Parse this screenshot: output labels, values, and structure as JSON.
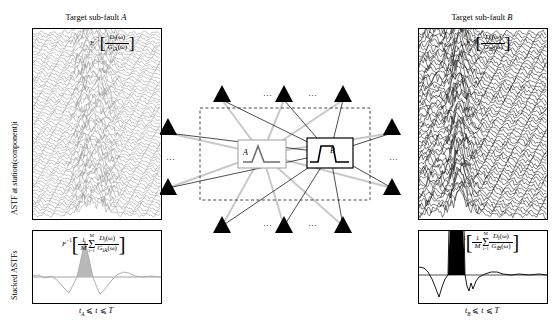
{
  "figure": {
    "type": "seismology-diagram"
  },
  "panels": {
    "left_top": {
      "title_prefix": "Target sub-fault ",
      "title_italic": "A",
      "y_axis_label": "ASTF at station(component)i",
      "formula": {
        "operator": "F",
        "operator_exponent": "−1",
        "numerator": "D",
        "numerator_sub": "i",
        "numerator_arg": "(ω)",
        "denominator": "G",
        "denominator_sub": "iA",
        "denominator_arg": "(ω)"
      }
    },
    "left_bottom": {
      "y_axis_label": "Stacked ASTFs",
      "x_axis_label": "tₐ ⩽ t ⩽ T",
      "x_axis_sub": "A",
      "formula": {
        "operator": "F",
        "operator_exponent": "−1",
        "mean_numerator": "1",
        "mean_denominator": "M",
        "sigma_upper": "M",
        "sigma_lower": "i=1",
        "numerator": "D",
        "numerator_sub": "i",
        "numerator_arg": "(ω)",
        "denominator": "G",
        "denominator_sub": "iA",
        "denominator_arg": "(ω)"
      }
    },
    "right_top": {
      "title_prefix": "Target sub-fault ",
      "title_italic": "B",
      "formula": {
        "operator": "F",
        "operator_exponent": "−1",
        "numerator": "D",
        "numerator_sub": "i",
        "numerator_arg": "(ω)",
        "denominator": "G",
        "denominator_sub": "iB",
        "denominator_arg": "(ω)"
      }
    },
    "right_bottom": {
      "x_axis_label": "t_B ⩽ t ⩽ T",
      "x_axis_sub": "B",
      "formula": {
        "operator": "F",
        "operator_exponent": "−1",
        "mean_numerator": "1",
        "mean_denominator": "M",
        "sigma_upper": "M",
        "sigma_lower": "i=1",
        "numerator": "D",
        "numerator_sub": "i",
        "numerator_arg": "(ω)",
        "denominator": "G",
        "denominator_sub": "iB",
        "denominator_arg": "(ω)"
      }
    }
  },
  "centre_diagram": {
    "subfault_a_label": "A",
    "subfault_b_label": "B",
    "ellipsis": "…",
    "station_count_visible": 10,
    "dashed_box": true
  },
  "colors": {
    "subfault_a": "#808080",
    "subfault_b": "#000000",
    "station": "#000000",
    "ray_a": "#c8c8c8",
    "ray_b": "#000000",
    "panel_border": "#000000"
  },
  "chart_data": {
    "type": "line",
    "xlabel": "time",
    "ylabel": "amplitude",
    "series": [
      {
        "name": "Stacked ASTF A",
        "color": "#808080",
        "peak_time": 0.42,
        "peak_amplitude": 1.0,
        "values": [
          0.05,
          0.02,
          0.06,
          0.1,
          -0.12,
          -0.45,
          0.0,
          1.0,
          0.0,
          -0.5,
          -0.15,
          0.12,
          0.16,
          0.05,
          0.02
        ]
      },
      {
        "name": "Stacked ASTF B",
        "color": "#000000",
        "peak_time": 0.4,
        "peak_amplitude": 1.0,
        "values": [
          0.15,
          0.1,
          -0.1,
          -0.9,
          -0.2,
          1.0,
          1.0,
          -0.55,
          -0.2,
          -0.4,
          0.1,
          0.12,
          0.05,
          0.08,
          0.02
        ]
      }
    ]
  }
}
